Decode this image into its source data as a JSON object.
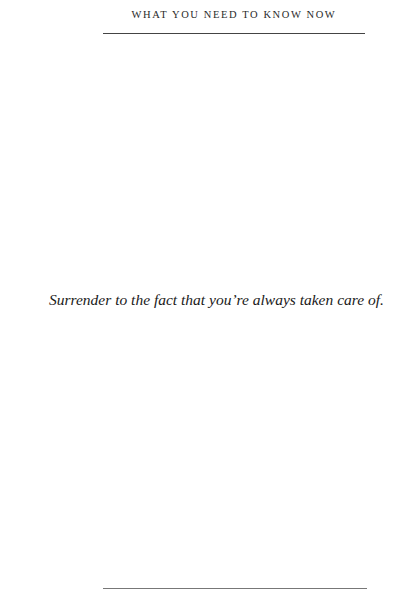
{
  "page": {
    "running_head": "WHAT YOU NEED TO KNOW NOW",
    "body_text": "Surrender to the fact that you’re always taken care of."
  }
}
